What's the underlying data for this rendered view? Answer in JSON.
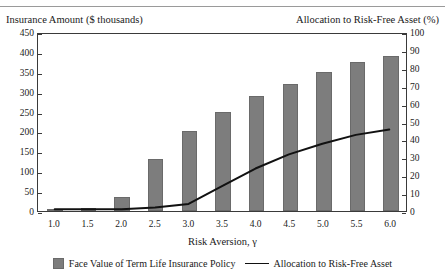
{
  "header": {
    "left_axis_title": "Insurance Amount ($ thousands)",
    "right_axis_title": "Allocation to Risk-Free Asset (%)"
  },
  "legend": {
    "bar_label": "Face Value of Term Life Insurance Policy",
    "line_label": "Allocation to Risk-Free Asset",
    "bar_swatch_color": "#7d7d7d",
    "line_swatch_color": "#111111"
  },
  "chart_data": {
    "type": "bar",
    "title": "",
    "xlabel": "Risk Aversion, γ",
    "ylabel": "Insurance Amount ($ thousands)",
    "y2label": "Allocation to Risk-Free Asset (%)",
    "categories": [
      "1.0",
      "1.5",
      "2.0",
      "2.5",
      "3.0",
      "3.5",
      "4.0",
      "4.5",
      "5.0",
      "5.5",
      "6.0"
    ],
    "ylim": [
      0,
      450
    ],
    "y2lim": [
      0,
      100
    ],
    "yticks": [
      0,
      50,
      100,
      150,
      200,
      250,
      300,
      350,
      400,
      450
    ],
    "y2ticks": [
      0,
      10,
      20,
      30,
      40,
      50,
      60,
      70,
      80,
      90,
      100
    ],
    "grid": false,
    "legend_position": "bottom",
    "series": [
      {
        "name": "Face Value of Term Life Insurance Policy",
        "type": "bar",
        "axis": "left",
        "color": "#7d7d7d",
        "values": [
          5,
          8,
          35,
          130,
          200,
          250,
          290,
          320,
          350,
          375,
          390
        ]
      },
      {
        "name": "Allocation to Risk-Free Asset",
        "type": "line",
        "axis": "right",
        "color": "#111111",
        "values": [
          1,
          1,
          1,
          2,
          4,
          14,
          24,
          32,
          38,
          43,
          46
        ]
      }
    ]
  }
}
